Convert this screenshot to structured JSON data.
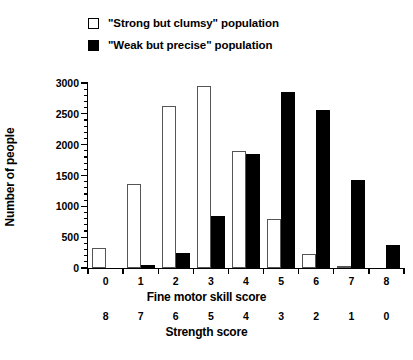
{
  "legend": {
    "items": [
      {
        "swatch": "hollow-square-swatch",
        "label": "\"Strong but clumsy\" population"
      },
      {
        "swatch": "filled-square-swatch",
        "label": "\"Weak but precise\" population"
      }
    ]
  },
  "chart_data": {
    "type": "bar",
    "title": "",
    "ylabel": "Number of people",
    "xlabel": "Fine motor skill score",
    "secondary_xlabel": "Strength score",
    "categories": [
      "0",
      "1",
      "2",
      "3",
      "4",
      "5",
      "6",
      "7",
      "8"
    ],
    "secondary_categories": [
      "8",
      "7",
      "6",
      "5",
      "4",
      "3",
      "2",
      "1",
      "0"
    ],
    "ylim": [
      0,
      3000
    ],
    "yticks": [
      0,
      500,
      1000,
      1500,
      2000,
      2500,
      3000
    ],
    "ytick_labels": [
      "0",
      "500",
      "1000",
      "1500",
      "2000",
      "2500",
      "3000"
    ],
    "minor_tick_step": 100,
    "grid": false,
    "legend_position": "top-left",
    "series": [
      {
        "name": "\"Strong but clumsy\" population",
        "style": "hollow",
        "values": [
          320,
          1370,
          2620,
          2950,
          1890,
          800,
          220,
          30,
          0
        ]
      },
      {
        "name": "\"Weak but precise\" population",
        "style": "filled",
        "values": [
          0,
          50,
          240,
          840,
          1850,
          2850,
          2570,
          1430,
          370
        ]
      }
    ]
  },
  "colors": {
    "axis": "#000000",
    "hollow_fill": "#ffffff",
    "hollow_stroke": "#555555",
    "filled_fill": "#000000"
  }
}
